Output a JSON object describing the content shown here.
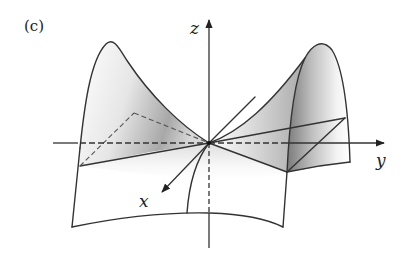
{
  "figure": {
    "panel_label": "(c)",
    "axes": {
      "x": {
        "label": "x"
      },
      "y": {
        "label": "y"
      },
      "z": {
        "label": "z"
      }
    },
    "colors": {
      "line": "#333333",
      "shade_dark": "#8a8a8a",
      "shade_light": "#ffffff",
      "background": "#ffffff"
    }
  }
}
